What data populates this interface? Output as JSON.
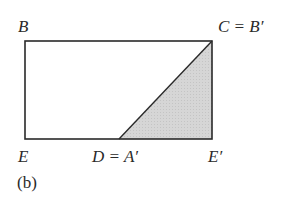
{
  "figure": {
    "caption": "(b)",
    "labels": {
      "B": "B",
      "C": "C = B′",
      "E": "E",
      "D": "D = A′",
      "E_prime": "E′"
    },
    "colors": {
      "stroke": "#2a2a2a",
      "shade": "#d4d4d4",
      "background": "#ffffff"
    }
  }
}
